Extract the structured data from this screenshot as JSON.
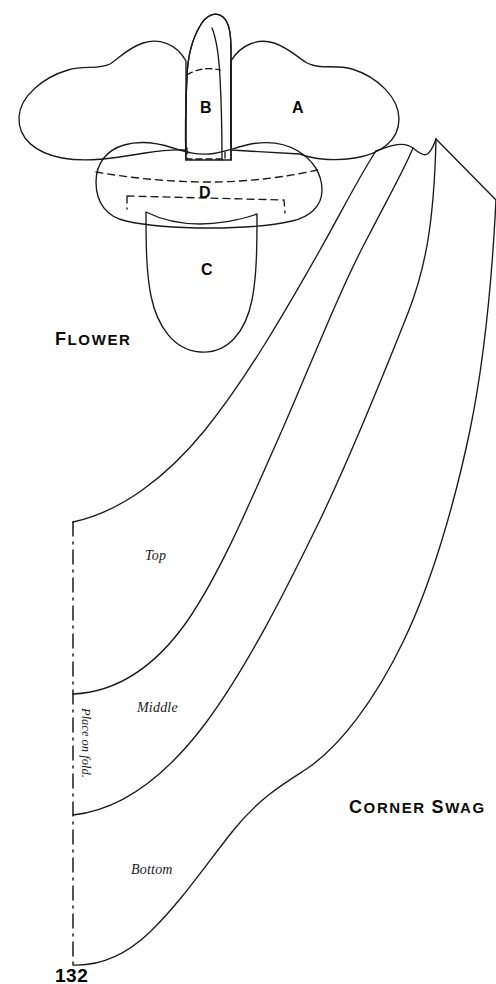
{
  "page": {
    "number": "132",
    "background_color": "#ffffff",
    "ink_color": "#1a1a1a"
  },
  "flower": {
    "title": "Flower",
    "title_first_letter": "F",
    "title_rest": "LOWER",
    "pieces": [
      {
        "id": "A",
        "label": "A"
      },
      {
        "id": "B",
        "label": "B"
      },
      {
        "id": "C",
        "label": "C"
      },
      {
        "id": "D",
        "label": "D"
      }
    ]
  },
  "corner_swag": {
    "title": "Corner Swag",
    "title_words": [
      {
        "first": "C",
        "rest": "ORNER"
      },
      {
        "first": "S",
        "rest": "WAG"
      }
    ],
    "fold_label": "Place on fold.",
    "sections": [
      {
        "id": "top",
        "label": "Top"
      },
      {
        "id": "middle",
        "label": "Middle"
      },
      {
        "id": "bottom",
        "label": "Bottom"
      }
    ]
  }
}
